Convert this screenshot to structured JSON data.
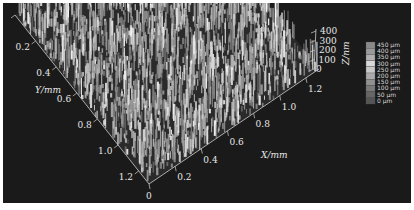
{
  "chart_data": {
    "type": "surface3d",
    "title": "",
    "x_axis": {
      "label": "X/mm",
      "ticks": [
        "0",
        "0.2",
        "0.4",
        "0.6",
        "0.8",
        "1.0",
        "1.2"
      ],
      "range": [
        0,
        1.3
      ]
    },
    "y_axis": {
      "label": "Y/mm",
      "ticks": [
        "0",
        "0.2",
        "0.4",
        "0.6",
        "0.8",
        "1.0",
        "1.2"
      ],
      "range": [
        0,
        1.3
      ]
    },
    "z_axis": {
      "label": "Z/nm",
      "ticks": [
        "0",
        "100",
        "200",
        "300",
        "400"
      ],
      "range": [
        0,
        450
      ]
    },
    "colorbar": {
      "labels": [
        "450 μm",
        "400 μm",
        "350 μm",
        "300 μm",
        "250 μm",
        "200 μm",
        "150 μm",
        "100 μm",
        "50 μm",
        "0 μm"
      ],
      "colors": [
        "#8a8a8a",
        "#9a9a9a",
        "#b0b0b0",
        "#d8d8d8",
        "#c8c8c8",
        "#aaaaaa",
        "#909090",
        "#7a7a7a",
        "#666666",
        "#555555"
      ]
    },
    "background": "#1a1a1a",
    "grid": false,
    "legend_position": "right"
  }
}
